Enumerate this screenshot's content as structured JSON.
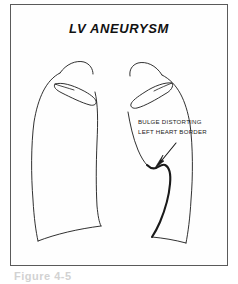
{
  "figure": {
    "title": "LV ANEURYSM",
    "annotation_line1": "BULGE DISTORTING",
    "annotation_line2": "LEFT HEART BORDER",
    "caption_partial": "Figure 4-5",
    "colors": {
      "frame_border": "#5a5a5a",
      "background": "#ffffff",
      "line": "#1a1a1a",
      "title_text": "#111111",
      "annotation_text": "#1a1a1a",
      "caption_ghost": "#d2d2d2"
    },
    "diagram": {
      "type": "chest-radiograph-line-drawing",
      "subject": "left ventricular aneurysm on chest x-ray",
      "structures": [
        "right lung field outline",
        "left lung field outline",
        "right clavicle",
        "left clavicle",
        "mediastinal border",
        "left heart border bulge",
        "diaphragm",
        "costophrenic angles"
      ],
      "pointer": "arrow from annotation text down-left to left heart border bulge"
    }
  }
}
